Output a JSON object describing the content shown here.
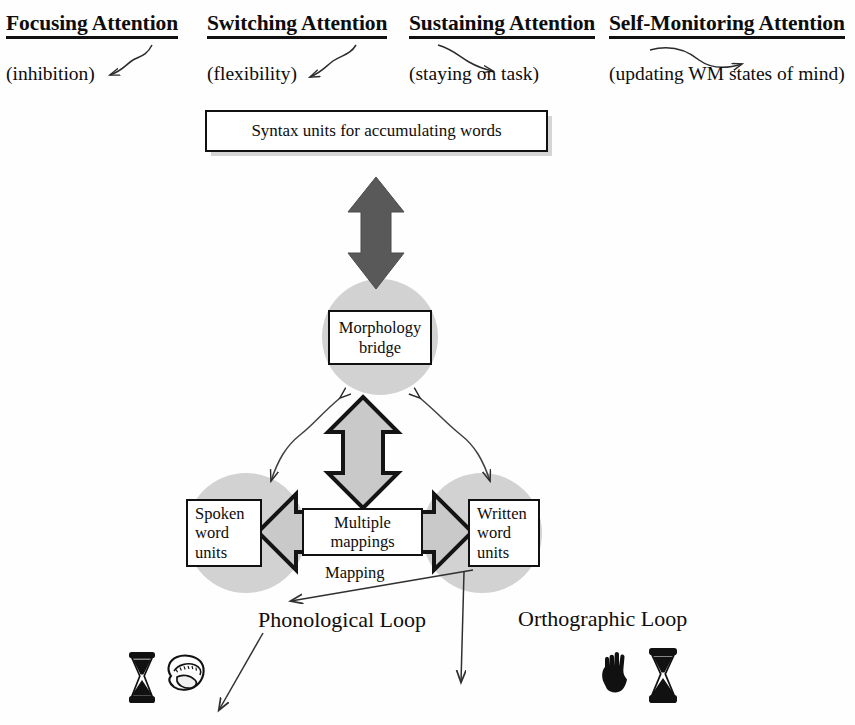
{
  "diagram": {
    "background_color": "#ffffff",
    "circle_fill_color": "#d2d2d2",
    "dark_arrow_color": "#595959",
    "hollow_arrow_fill": "#c9c9c9",
    "outline_color": "#111111"
  },
  "attention_header": {
    "columns": [
      {
        "title": "Focusing Attention",
        "subtitle": "(inhibition)",
        "arrow_direction": "down-left"
      },
      {
        "title": "Switching Attention",
        "subtitle": "(flexibility)",
        "arrow_direction": "down-left"
      },
      {
        "title": "Sustaining Attention",
        "subtitle": "(staying on task)",
        "arrow_direction": "down-right"
      },
      {
        "title": "Self-Monitoring Attention",
        "subtitle": "(updating WM states of mind)",
        "arrow_direction": "right"
      }
    ]
  },
  "nodes": {
    "syntax": {
      "label": "Syntax units for accumulating words"
    },
    "morphology": {
      "line1": "Morphology",
      "line2": "bridge"
    },
    "spoken": {
      "line1": "Spoken",
      "line2": "word",
      "line3": "units"
    },
    "mappings": {
      "line1": "Multiple",
      "line2": "mappings"
    },
    "written": {
      "line1": "Written",
      "line2": "word",
      "line3": "units"
    }
  },
  "captions": {
    "mapping": "Mapping",
    "phonological_loop": "Phonological Loop",
    "orthographic_loop": "Orthographic Loop"
  },
  "icons": {
    "hourglass_left": "hourglass-icon",
    "mouth": "mouth-icon",
    "hand": "hand-icon",
    "hourglass_right": "hourglass-icon"
  },
  "connectors": [
    {
      "name": "syntax-to-morphology",
      "style": "solid-dark-double-arrow",
      "orientation": "vertical"
    },
    {
      "name": "morphology-to-mappings",
      "style": "hollow-double-arrow",
      "orientation": "vertical"
    },
    {
      "name": "mappings-to-spoken",
      "style": "hollow-arrow",
      "orientation": "left"
    },
    {
      "name": "mappings-to-written",
      "style": "hollow-arrow",
      "orientation": "right"
    },
    {
      "name": "morphology-to-spoken-curve",
      "style": "thin-curved-double-arrow"
    },
    {
      "name": "morphology-to-written-curve",
      "style": "thin-curved-double-arrow"
    },
    {
      "name": "written-to-phonological-loop",
      "style": "thin-line-arrow"
    },
    {
      "name": "written-down-arrow",
      "style": "thin-line-arrow"
    },
    {
      "name": "phonological-loop-down-left-arrow",
      "style": "thin-line-arrow"
    }
  ]
}
